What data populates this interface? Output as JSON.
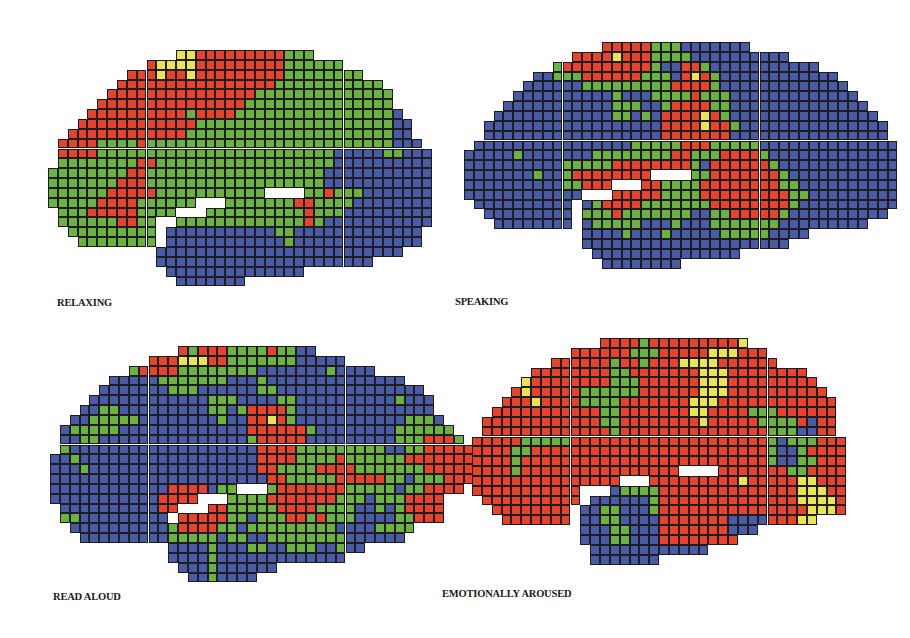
{
  "figure": {
    "cell_size": 9.85,
    "colors": {
      "R": "#e6432a",
      "G": "#6cb23e",
      "B": "#4a5ba5",
      "Y": "#e9e54c",
      "W": "#ffffff"
    },
    "panels": [
      {
        "id": "relaxing",
        "label": "RELAXING",
        "origin": [
          48,
          50
        ],
        "label_pos": [
          57,
          297
        ],
        "rows": [
          ".............YYRRRRRRRRRGGG",
          "..........RYYYYRRRRRRRRRGGGGGG",
          "........RRRYRRYRRRRRRRRRGGGGGGGG",
          ".......RRRRRRRRRRRRRRRRGGGGGGGGGGG",
          "......RRRRRRRRRRRRRRRGGGGGGGGGGGGGG",
          ".....RRRRRRRRRRRRRRRGGGGGGGGGGGGGGG",
          "....RRRRRRRRRRGRRRRGGGGGGGGGGGGGGGGB",
          "...RRRRRRRRRRRRGGGGGGGGGGGGGGGGGGGGBB",
          "..RRRRRRRRRRRRGGGGGGGGGGGGGGGGGGGGGBB",
          ".RRRRGGGGRGGGGGGGGGGGGGGGGGGGGGGGGGBBB",
          ".RRRRGGGGGGGGGGGGGGGGGGGGGGGGBBBBBGGBBB",
          ".GGGGGGGGRRGGGGGGGGGGGGGGGGGGBBBBBBBBBB",
          "GGGGGGGGRRGGGGGGGGGGGGGGGGGGBBBBBBBBBBB",
          "GGGGGGGRRRGGGGGGGGGGGGGGGGGGBBBBBBBBBBB",
          "GGGGGGRRRRRGGGGGGGGGGGWWWWGGRGGGBBBBBBB",
          "GGGGGRRRRGGGGGGWWWGGGGGGGRRGGGGBBBBBBBB",
          ".GGGRRRRRGGGGWWWGGGGGGGGGGRGGGBBBBBBBBB",
          ".GGGGGGRRGGWWGGGGGGGGGGGGGRGBBBBBBBBBBB",
          "..GGGGGGGGGWBBBBBBBBBBBGGBBBBBBBBBBBBB",
          "...GGGGGGGG.BBBBBBBBBBBBGBBBBBBBBBBBBB",
          "...........BBBBBBBBBBBBBBBBBBBBBBBBB",
          "...........BBBBBBBBBBBBBBBBBBBBBB",
          "............BBBBBBBBBBBBBB",
          ".............BBBBBBB"
        ]
      },
      {
        "id": "speaking",
        "label": "SPEAKING",
        "origin": [
          464,
          42
        ],
        "label_pos": [
          455,
          296
        ],
        "rows": [
          "..............RRRRRGGGBBBBBBB",
          "...........RRRRYRRRGGGGBBBBBBBBBB",
          ".........GRRRRRRRRRGBBRRGBBBBBBBBBBB",
          ".......BBGGGRRRRRRGGGBRYRGBBBBBBBBBBBB",
          "......BBBBBBGGGGGGGGGRRRRGBBBBBBBBBBBBB",
          ".....BBBBBBBBBBGBBBGGGGRGGGBBBBBBBBBBBBB",
          "....BBBBBBBBBBBGGGBBGRRRRGGBBBBBBBBBBBBBB",
          "...BBBBBBBBBBBBGGBGBRRRRYRGBBBBBBBBBBBBBBB",
          "..BBBBBBBBBBBBBBBBBBRRRRYRRGBBBBBBBBBBBBBBB",
          "..BBBBBBBBBBBBBBBBBBRRRRRRRBBBBBBBBBBBBBBBB",
          ".BBBBBBBBBBBBBBBBGGGGGRRRGGGGGBBBBBBBBBBBBBB",
          "BBBBBGBBBBBBBGGGGGGGGRRGGGRRRRGBBBBBBBBBBBBB",
          "BBBBBBBBBBGGGGGRRRRRRRRGBRRRRRRGBBBBBBBBBBBB",
          "BBBBBBBGBBGRRRRRRRRWWWWGGRRRRRRRGBBBBBBBBBBB",
          "BBBBBBBBBBGGRRRWWWRRGGGGRRRRRRRRGGBBBBBBBBBB",
          "BBBBBBBBBBBBWWWRRRRRGGGGRRRRRRRRRGGBBBBBBBBB",
          ".BBBBBBBBBBWBGRRRRGGGGGGGRRRRRRRRGBBBBBBBBBB",
          "..BBBBBBBBB.GGGRGGGGGGGBBGGRRRRRGBBBBBBBBBB",
          "...BBBBBBBB.BGGGGGBBBGBBBGGGGGGGBBBBBBBBB",
          "............BBBBGBBBGBBBBBGGGGGBBBB",
          "............BBBBBBBBBBBBBBBBBBBBB",
          ".............BBBBBBBBBBBBBBB",
          "..............BBBBBBBB"
        ]
      },
      {
        "id": "read-aloud",
        "label": "READ ALOUD",
        "origin": [
          50,
          346
        ],
        "label_pos": [
          53,
          591
        ],
        "rows": [
          ".............RGRRRGGGGRGGBB",
          "..........RRRYYYRRGGGGGGGBBBBB",
          "........GRRRRGGGGGGGGBBBBBBBGBBBB",
          "......BBBBBGGGGGGGBBBGBBBBBBBBBBBBBB",
          ".....BBBBBBBGGGBBBBBBGGBBBBBBBBBBBBBBB",
          "....BBBBBBBBBBBBGGGBBBBGGBBBBBBBBBBGBBB",
          "...BBGGBBBBBBBBBGGBGRRRRGBBBBBBBBBBBBBB",
          "..BBGGGGGBBBBBBBBGBBRRYRGBBBBBBBBBBBGGGB",
          ".BGGGGGBBBBBBBBBBBBBRRRRRRGBBBBBBBBGGGGGG",
          ".BBGGBBBBBBBBBBBBBBBGRRRRRBBBBBBBBBGGGRRRG",
          ".GBBBBBBBBBBBBBBBBBBBRRRRGGGGGGGGGBBGGRRRRR",
          "BBGBBBBBBBBBBBBBBBBBBRRRRGGGGRGGGGGGRRRRRRR",
          "BBBGBBBBBBBBBBBBBBBBBRRGGGGRRRRGGGGGGGRRRRR",
          "BBBBBBBBBBBBBBBBBBBBBBRRGGGGGRRRRRGGBGGGRRRR",
          "BBBBBBBBBBBBRRRRBGGWWWGRRRRRRRGGGGGBGGRRRR",
          "BBBBBBBBBBBRRRRWWWGGGGRRRRRRRGGGBGGGRRRR",
          ".BBBBBBBBBBRRWWWRRGGGGGRRRRGGGGBBGBGRRRR",
          ".GGBBBBBBBBBWRRRRRGGBGGGRRGRGGGBBBBGGRRR",
          "..BBBBBBBBBBGRRRRGGBGGGGGGGGGBBBBGGGG",
          "...BBBBBBBBBGGGGGBGGBBGGGGGGGGBBBBBB",
          "............BBBBGBBBGGBBGGGBBGBB",
          "............BBBBGBBBBBBBBBBBBB",
          ".............BBBGBBBBBB",
          "..............BBGBBBB"
        ]
      },
      {
        "id": "emotionally-aroused",
        "label": "EMOTIONALLY AROUSED",
        "origin": [
          472,
          338
        ],
        "label_pos": [
          442,
          588
        ],
        "rows": [
          ".............RRRRGRRRRRRRRRY",
          "..........RRRRRRGGGRRRRRYYYRRR",
          "........RRRRRRGRRGRRRYYYYRRRRRR",
          "......RRRRRRRRGGRRRRRRRYYYRRRRRRRR",
          ".....YRRRRRRRRGGGRRRRRRYYYRRRRRRRRR",
          "....RYRRRRRGGGGGGRRRRRRYYYRRRRRRRRRR",
          "...RRRYRRRRGGGGRRRRRRRYYYRRRRRRRRRRRR",
          "..RRRRRRRRRRRGGRRRRRRRYYRRRRGGGRRRRRR",
          ".RRRRRRRRRRRRGGRRRRRRRRYRRRRRGGGGRBRR",
          ".RRRRRRRRRRRRRGRRRRRRRRRRRRRRRGGGBBRR",
          "RRRRRGGGGGRRRRRRRRRRRRRRRRRRRRGBGGGRRR",
          "RRRRGGRRRRRRRRRRRRRRRRRRRRRRRRGBBGRRRR",
          "RRRRGRRRRRRRRRRRRRRRRRRRRRRRRRGBBGGRRR",
          "RRRRGRRRRRRRRRRRRRRRRWWWWRRRRRRRGGRRRR",
          "RRRRRRRRRRRRRRRWWWRRRRRRRRRYRRRRRYYRRR",
          "RRRRRRRRRRRWWWBGGGGRRRRRRRRRRRRRRYYYRR",
          ".RRRRRRRRRRWBBBBBBGRRRRRRRRRRRRRRYYYYR",
          "..RRRRRRRR.BBGGBBBGRRRRRRRRRRRRRRRYYYR",
          "...RRRRRRR.BBGGBBBBRRRRRRRBBBBRRRYY",
          "...........BBBGGBBBRRRRRRRBBB",
          "...........BBBGGBBBRRRRRRRR",
          "............BBBBBBBBBBBB",
          "............BBBBBBB"
        ]
      }
    ]
  }
}
